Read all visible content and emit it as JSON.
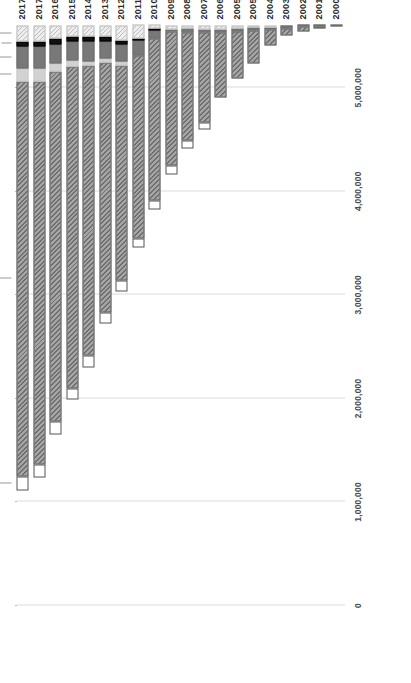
{
  "chart_data": {
    "type": "bar",
    "orientation": "horizontal-stacked",
    "title": "",
    "subtitle": "",
    "xlabel": "",
    "ylabel": "",
    "xlim": [
      0,
      5600000
    ],
    "grid": true,
    "legend_position": "top-inline-annotations",
    "x_tick_labels": [
      "0",
      "1,000,000",
      "2,000,000",
      "3,000,000",
      "4,000,000",
      "5,000,000"
    ],
    "x_tick_values": [
      0,
      1000000,
      2000000,
      3000000,
      4000000,
      5000000
    ],
    "categories": [
      "2000",
      "2001",
      "2002",
      "2003",
      "2004",
      "2005",
      "2005",
      "2006",
      "2007",
      "2008",
      "2009",
      "2010",
      "2011",
      "2012",
      "2013",
      "2014",
      "2015",
      "2016",
      "2017",
      "2017"
    ],
    "series_order": [
      "FORD",
      "GM",
      "HONDA",
      "HYUNDAI",
      "TOYOTA",
      "OTHER"
    ],
    "series": [
      {
        "name": "FORD",
        "color": "#d9d9d9",
        "pattern": "hatch",
        "values": [
          0,
          0,
          0,
          0,
          17000,
          22000,
          30000,
          34000,
          38000,
          33000,
          36000,
          40000,
          130000,
          140000,
          110000,
          110000,
          110000,
          130000,
          150000,
          150000
        ]
      },
      {
        "name": "GM",
        "color": "#111111",
        "pattern": "solid",
        "values": [
          0,
          0,
          0,
          0,
          0,
          0,
          0,
          0,
          0,
          0,
          0,
          8000,
          14000,
          40000,
          40000,
          48000,
          48000,
          56000,
          56000,
          56000
        ]
      },
      {
        "name": "HONDA",
        "color": "#787878",
        "pattern": "solid",
        "values": [
          0,
          6000,
          14000,
          26000,
          26000,
          26000,
          26000,
          32000,
          32000,
          31000,
          20000,
          82000,
          150000,
          170000,
          170000,
          190000,
          180000,
          180000,
          210000,
          210000
        ]
      },
      {
        "name": "HYUNDAI",
        "color": "#d2d2d2",
        "pattern": "solid",
        "values": [
          0,
          0,
          0,
          0,
          0,
          0,
          0,
          0,
          0,
          0,
          0,
          0,
          0,
          34000,
          34000,
          42000,
          56000,
          82000,
          120000,
          120000
        ]
      },
      {
        "name": "TOYOTA",
        "color": "#8e8e8e",
        "pattern": "hatch",
        "values": [
          12000,
          20000,
          40000,
          66000,
          150000,
          320000,
          460000,
          630000,
          870000,
          1050000,
          1300000,
          1560000,
          1760000,
          2080000,
          2420000,
          2800000,
          3110000,
          3380000,
          3700000,
          3820000
        ]
      },
      {
        "name": "OTHER",
        "color": "#ffffff",
        "pattern": "open",
        "values": [
          0,
          0,
          0,
          0,
          0,
          0,
          0,
          0,
          60000,
          72000,
          78000,
          88000,
          92000,
          100000,
          100000,
          110000,
          110000,
          120000,
          130000,
          130000
        ]
      }
    ],
    "annotations": [
      {
        "label": "OTHER",
        "series": "OTHER"
      },
      {
        "label": "TOYOTA",
        "series": "TOYOTA"
      },
      {
        "label": "HYUNDAI",
        "series": "HYUNDAI"
      },
      {
        "label": "HONDA",
        "series": "HONDA"
      },
      {
        "label": "GM",
        "series": "GM"
      },
      {
        "label": "FORD",
        "series": "FORD"
      }
    ]
  }
}
